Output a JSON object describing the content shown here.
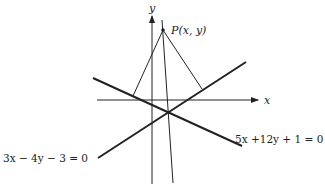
{
  "diagram": {
    "axes": {
      "x_label": "x",
      "y_label": "y"
    },
    "point": {
      "label": "P(x, y)"
    },
    "lines": [
      {
        "id": "line1",
        "equation": "5x +12y + 1 = 0"
      },
      {
        "id": "line2",
        "equation": "3x − 4y − 3 = 0"
      }
    ],
    "colors": {
      "stroke": "#222222",
      "background": "#ffffff"
    }
  }
}
